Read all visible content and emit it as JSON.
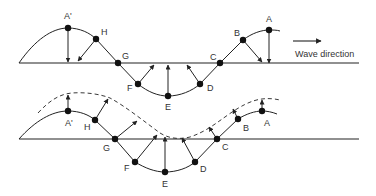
{
  "legend": {
    "arrow_label": "Wave direction"
  },
  "colors": {
    "ink": "#222222",
    "background": "#ffffff"
  },
  "top_panel": {
    "description": "Particle velocities on the wave profile",
    "labels": {
      "A_prime": "A'",
      "H": "H",
      "G": "G",
      "F": "F",
      "E": "E",
      "D": "D",
      "C": "C",
      "B": "B",
      "A": "A"
    }
  },
  "bottom_panel": {
    "description": "Particle displacement with dashed wave profile shifted",
    "labels": {
      "A_prime": "A'",
      "H": "H",
      "G": "G",
      "F": "F",
      "E": "E",
      "D": "D",
      "C": "C",
      "B": "B",
      "A": "A"
    }
  }
}
